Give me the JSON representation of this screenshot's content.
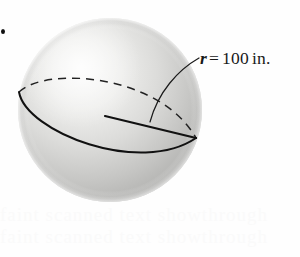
{
  "figure": {
    "type": "geometry-diagram",
    "label": {
      "variable": "r",
      "equals": "=",
      "value": "100",
      "unit": "in."
    },
    "colors": {
      "sphere_light": "#f2f2f1",
      "sphere_mid": "#cfcfcd",
      "sphere_dark": "#a9a9a7",
      "sphere_edge": "#bdbdbb",
      "line": "#111111",
      "leader": "#1a1a1a",
      "background": "#fefefe",
      "label_text": "#191919"
    },
    "geometry": {
      "sphere_center_x": 110,
      "sphere_center_y": 110,
      "sphere_radius": 92,
      "highlight_x": 78,
      "highlight_y": 70,
      "ellipse_left_vertex_x": 19,
      "ellipse_left_vertex_y": 92,
      "ellipse_right_vertex_x": 196,
      "ellipse_right_vertex_y": 138,
      "radius_start_x": 105,
      "radius_start_y": 116,
      "radius_end_x": 196,
      "radius_end_y": 138,
      "leader_start_x": 199,
      "leader_start_y": 58,
      "leader_end_x": 150,
      "leader_end_y": 122
    }
  },
  "annotations": {
    "corner_marker": "•",
    "ghost_text_lines": [
      "faint scanned text showthrough",
      "faint scanned text showthrough"
    ]
  }
}
